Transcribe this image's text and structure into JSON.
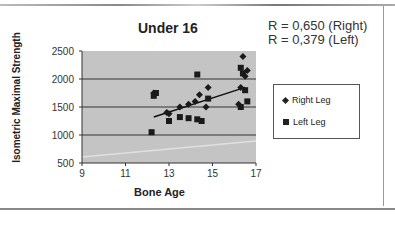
{
  "chart_data": {
    "type": "scatter",
    "title": "Under 16",
    "xlabel": "Bone Age",
    "ylabel": "Isometric Maximal Strength",
    "xlim": [
      9,
      17
    ],
    "ylim": [
      500,
      2500
    ],
    "xticks": [
      9,
      11,
      13,
      15,
      17
    ],
    "yticks": [
      500,
      1000,
      1500,
      2000,
      2500
    ],
    "grid": true,
    "legend_position": "right",
    "annotations": [
      "R = 0,650 (Right)",
      "R = 0,379 (Left)"
    ],
    "series": [
      {
        "name": "Right Leg",
        "marker": "diamond",
        "x": [
          12.3,
          12.9,
          13.0,
          13.5,
          13.9,
          14.2,
          14.4,
          14.7,
          14.8,
          16.2,
          16.3,
          16.5,
          16.6,
          16.4
        ],
        "y": [
          1750,
          1400,
          1380,
          1500,
          1550,
          1600,
          1720,
          1500,
          1850,
          1550,
          1850,
          2050,
          2150,
          2400
        ]
      },
      {
        "name": "Left Leg",
        "marker": "square",
        "x": [
          12.2,
          12.3,
          12.4,
          13.0,
          13.5,
          13.9,
          14.3,
          14.3,
          14.5,
          14.8,
          16.3,
          16.4,
          16.5,
          16.6,
          16.3
        ],
        "y": [
          1050,
          1700,
          1750,
          1250,
          1320,
          1300,
          1280,
          2080,
          1250,
          1650,
          2200,
          2100,
          1800,
          1600,
          1500
        ]
      }
    ],
    "trendlines": [
      {
        "series": "Right Leg",
        "x": [
          12.3,
          16.5
        ],
        "y": [
          1320,
          1850
        ]
      }
    ]
  },
  "labels": {
    "title": "Under 16",
    "r_right": "R = 0,650 (Right)",
    "r_left": "R = 0,379 (Left)",
    "xlabel": "Bone Age",
    "ylabel": "Isometric Maximal Strength",
    "legend_right": "Right Leg",
    "legend_left": "Left Leg"
  }
}
